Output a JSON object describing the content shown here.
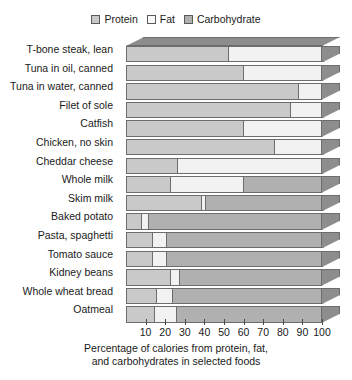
{
  "legend": {
    "items": [
      {
        "label": "Protein",
        "color": "#c9c9c9",
        "icon": "square-swatch-icon"
      },
      {
        "label": "Fat",
        "color": "#f2f2f2",
        "icon": "square-swatch-icon"
      },
      {
        "label": "Carbohydrate",
        "color": "#b0b0b0",
        "icon": "square-swatch-icon"
      }
    ]
  },
  "caption": {
    "line1": "Percentage of calories from protein, fat,",
    "line2": "and carbohydrates in selected foods"
  },
  "chart_data": {
    "type": "bar",
    "orientation": "horizontal",
    "stacked": true,
    "style": "3d-stacked-bar",
    "title": "",
    "subtitle": "",
    "xlabel": "Percentage of calories from protein, fat, and carbohydrates in selected foods",
    "ylabel": "",
    "xlim": [
      0,
      100
    ],
    "xticks": [
      10,
      20,
      30,
      40,
      50,
      60,
      70,
      80,
      90,
      100
    ],
    "xticklabels": [
      "10",
      "20",
      "30",
      "40",
      "50",
      "60",
      "70",
      "80",
      "90",
      "100"
    ],
    "grid": false,
    "legend_position": "top-center",
    "legend_entries": [
      "Protein",
      "Fat",
      "Carbohydrate"
    ],
    "categories": [
      "T-bone steak, lean",
      "Tuna in oil, canned",
      "Tuna in water, canned",
      "Filet of sole",
      "Catfish",
      "Chicken, no skin",
      "Cheddar cheese",
      "Whole milk",
      "Skim milk",
      "Baked potato",
      "Pasta, spaghetti",
      "Tomato sauce",
      "Kidney beans",
      "Whole wheat bread",
      "Oatmeal"
    ],
    "series": [
      {
        "name": "Protein",
        "color": "#c9c9c9",
        "values": [
          52,
          60,
          88,
          84,
          60,
          76,
          26,
          22,
          38,
          7,
          13,
          13,
          22,
          15,
          14
        ]
      },
      {
        "name": "Fat",
        "color": "#f2f2f2",
        "values": [
          48,
          40,
          12,
          16,
          40,
          24,
          74,
          38,
          2,
          4,
          7,
          7,
          5,
          8,
          11
        ]
      },
      {
        "name": "Carbohydrate",
        "color": "#b0b0b0",
        "values": [
          0,
          0,
          0,
          0,
          0,
          0,
          0,
          40,
          60,
          89,
          80,
          80,
          73,
          77,
          75
        ]
      }
    ]
  }
}
